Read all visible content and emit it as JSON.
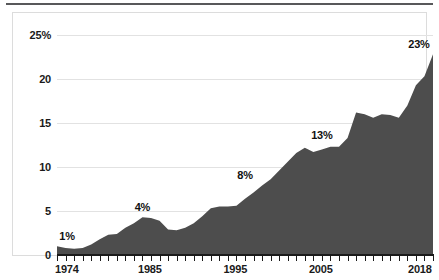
{
  "figure": {
    "background_color": "#ffffff",
    "frame_color": "#dcdcdc",
    "rule_color": "#58585a",
    "caption_text": ""
  },
  "chart_data": {
    "type": "area",
    "title": "",
    "subtitle": "",
    "xlabel": "",
    "ylabel": "",
    "xlim": [
      1974,
      2018
    ],
    "ylim": [
      0,
      25
    ],
    "grid": true,
    "legend": null,
    "area_color": "#4d4d4d",
    "gridline_color": "#e2e2e2",
    "axis_color": "#1a1a1a",
    "ytick_labels": [
      "25%",
      "20",
      "15",
      "10",
      "5",
      "0"
    ],
    "ytick_values": [
      25,
      20,
      15,
      10,
      5,
      0
    ],
    "xtick_labels": [
      "1974",
      "1985",
      "1995",
      "2005",
      "2018"
    ],
    "xtick_values": [
      1974,
      1985,
      1995,
      2005,
      2018
    ],
    "xtick_interval_years": 1,
    "annotations": [
      {
        "label": "1%",
        "x": 1974,
        "y": 1
      },
      {
        "label": "4%",
        "x": 1984,
        "y": 4.3
      },
      {
        "label": "8%",
        "x": 1996,
        "y": 7.9
      },
      {
        "label": "13%",
        "x": 2005,
        "y": 12.5
      },
      {
        "label": "23%",
        "x": 2018,
        "y": 22.8
      }
    ],
    "x": [
      1974,
      1975,
      1976,
      1977,
      1978,
      1979,
      1980,
      1981,
      1982,
      1983,
      1984,
      1985,
      1986,
      1987,
      1988,
      1989,
      1990,
      1991,
      1992,
      1993,
      1994,
      1995,
      1996,
      1997,
      1998,
      1999,
      2000,
      2001,
      2002,
      2003,
      2004,
      2005,
      2006,
      2007,
      2008,
      2009,
      2010,
      2011,
      2012,
      2013,
      2014,
      2015,
      2016,
      2017,
      2018
    ],
    "values": [
      1.0,
      0.8,
      0.7,
      0.8,
      1.2,
      1.8,
      2.3,
      2.4,
      3.1,
      3.6,
      4.3,
      4.2,
      3.9,
      2.9,
      2.8,
      3.1,
      3.6,
      4.4,
      5.3,
      5.5,
      5.5,
      5.6,
      6.4,
      7.1,
      7.9,
      8.6,
      9.6,
      10.6,
      11.6,
      12.2,
      11.7,
      12.0,
      12.3,
      12.3,
      13.3,
      16.2,
      16.0,
      15.6,
      16.0,
      15.9,
      15.6,
      17.0,
      19.3,
      20.3,
      22.8
    ]
  }
}
